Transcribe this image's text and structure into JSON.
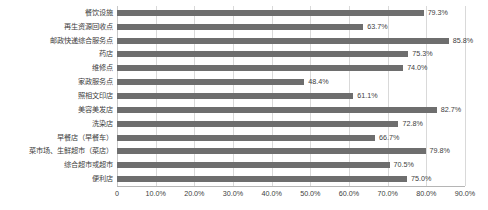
{
  "chart_data": {
    "type": "bar",
    "orientation": "horizontal",
    "title": "",
    "subtitle": "",
    "xlabel": "",
    "ylabel": "",
    "xlim": [
      0,
      90
    ],
    "grid": true,
    "legend": false,
    "legend_position": "none",
    "value_suffix": "%",
    "bar_color": "#6e6e6e",
    "gridline_color": "#d9d9d9",
    "axis_color": "#b5b5b5",
    "text_color": "#404040",
    "categories": [
      "餐饮设施",
      "再生资源回收点",
      "邮政快递综合服务点",
      "药店",
      "维修点",
      "家政服务点",
      "照相文印店",
      "美容美发店",
      "洗染店",
      "早餐店（早餐车）",
      "菜市场、生鲜超市（菜店）",
      "综合超市或超市",
      "便利店"
    ],
    "values": [
      79.3,
      63.7,
      85.8,
      75.3,
      74.0,
      48.4,
      61.1,
      82.7,
      72.8,
      66.7,
      79.8,
      70.5,
      75.0
    ],
    "data_labels": [
      "79.3%",
      "63.7%",
      "85.8%",
      "75.3%",
      "74.0%",
      "48.4%",
      "61.1%",
      "82.7%",
      "72.8%",
      "66.7%",
      "79.8%",
      "70.5%",
      "75.0%"
    ],
    "xticks": [
      0,
      10,
      20,
      30,
      40,
      50,
      60,
      70,
      80,
      90
    ],
    "xtick_labels": [
      "0",
      "10.0%",
      "20.0%",
      "30.0%",
      "40.0%",
      "50.0%",
      "60.0%",
      "70.0%",
      "80.0%",
      "90.0%"
    ]
  }
}
